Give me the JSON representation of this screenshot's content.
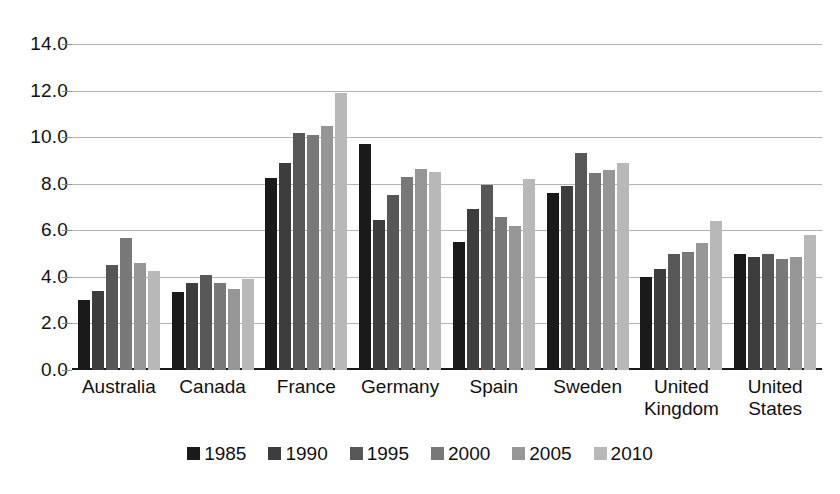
{
  "chart_data": {
    "type": "bar",
    "title": "",
    "subtitle": "",
    "xlabel": "",
    "ylabel": "",
    "ylim": [
      0.0,
      14.0
    ],
    "ytick_step": 2.0,
    "ytick_labels": [
      "0.0",
      "2.0",
      "4.0",
      "6.0",
      "8.0",
      "10.0",
      "12.0",
      "14.0"
    ],
    "ytick_values": [
      0.0,
      2.0,
      4.0,
      6.0,
      8.0,
      10.0,
      12.0,
      14.0
    ],
    "grid": true,
    "grid_axis": "y",
    "legend_position": "bottom",
    "categories": [
      "Australia",
      "Canada",
      "France",
      "Germany",
      "Spain",
      "Sweden",
      "United Kingdom",
      "United States"
    ],
    "category_lines": [
      [
        "Australia",
        ""
      ],
      [
        "Canada",
        ""
      ],
      [
        "France",
        ""
      ],
      [
        "Germany",
        ""
      ],
      [
        "Spain",
        ""
      ],
      [
        "Sweden",
        ""
      ],
      [
        "United",
        "Kingdom"
      ],
      [
        "United",
        "States"
      ]
    ],
    "series": [
      {
        "name": "1985",
        "color": "#1a1a1a",
        "values": [
          3.0,
          3.35,
          8.25,
          9.7,
          5.5,
          7.6,
          4.0,
          5.0
        ]
      },
      {
        "name": "1990",
        "color": "#3d3d3d",
        "values": [
          3.4,
          3.75,
          8.9,
          6.45,
          6.9,
          7.9,
          4.35,
          4.85
        ]
      },
      {
        "name": "1995",
        "color": "#575757",
        "values": [
          4.5,
          4.1,
          10.2,
          7.5,
          7.95,
          9.3,
          5.0,
          5.0
        ]
      },
      {
        "name": "2000",
        "color": "#787878",
        "values": [
          5.65,
          3.75,
          10.1,
          8.3,
          6.55,
          8.45,
          5.05,
          4.75
        ]
      },
      {
        "name": "2005",
        "color": "#969696",
        "values": [
          4.6,
          3.5,
          10.5,
          8.65,
          6.2,
          8.6,
          5.45,
          4.85
        ]
      },
      {
        "name": "2010",
        "color": "#b8b8b8",
        "values": [
          4.25,
          3.9,
          11.9,
          8.5,
          8.2,
          8.9,
          6.4,
          5.8
        ]
      }
    ]
  },
  "legend": {
    "items": [
      "1985",
      "1990",
      "1995",
      "2000",
      "2005",
      "2010"
    ]
  },
  "colors": {
    "gridline": "#b4b4b4",
    "axis": "#1a1a1a",
    "text": "#111111",
    "background": "#ffffff"
  }
}
